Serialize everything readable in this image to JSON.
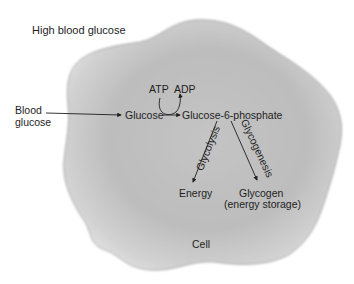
{
  "diagram": {
    "title_label": "High blood glucose",
    "external": {
      "line1": "Blood",
      "line2": "glucose"
    },
    "nodes": {
      "glucose": "Glucose",
      "g6p": "Glucose-6-phosphate",
      "atp": "ATP",
      "adp": "ADP",
      "energy": "Energy",
      "glycogen": "Glycogen",
      "glycogen_note": "(energy storage)",
      "cell": "Cell"
    },
    "pathways": {
      "glycolysis": "Glycolysis",
      "glycogenesis": "Glycogenesis"
    },
    "colors": {
      "cell_fill": "#c9c9c9",
      "cell_edge": "#9a9a9a",
      "text": "#1e1e1e",
      "background": "#ffffff"
    }
  }
}
